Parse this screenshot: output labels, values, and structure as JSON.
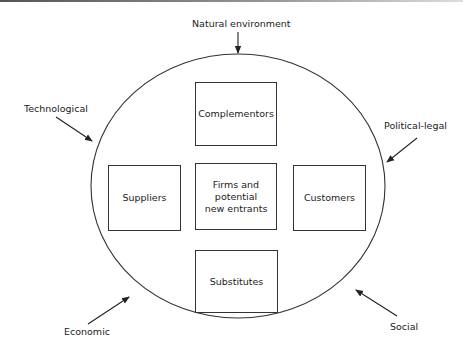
{
  "diagram": {
    "type": "environment-model",
    "external_forces": [
      {
        "id": "natural",
        "label": "Natural environment"
      },
      {
        "id": "technological",
        "label": "Technological"
      },
      {
        "id": "political",
        "label": "Political-legal"
      },
      {
        "id": "economic",
        "label": "Economic"
      },
      {
        "id": "social",
        "label": "Social"
      }
    ],
    "boxes": [
      {
        "id": "complementors",
        "label": "Complementors"
      },
      {
        "id": "suppliers",
        "label": "Suppliers"
      },
      {
        "id": "firms",
        "label": "Firms and\npotential\nnew entrants"
      },
      {
        "id": "customers",
        "label": "Customers"
      },
      {
        "id": "substitutes",
        "label": "Substitutes"
      }
    ],
    "colors": {
      "line": "#333333",
      "text": "#222222",
      "background": "#ffffff"
    }
  }
}
